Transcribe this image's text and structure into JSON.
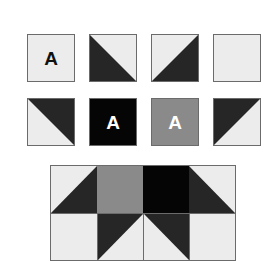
{
  "colors": {
    "light": "#ececec",
    "dark": "#262626",
    "black": "#050505",
    "gray": "#8a8a8a",
    "border": "#6b6b6b",
    "letter_dark": "#111111",
    "letter_light": "#ffffff"
  },
  "tiles": {
    "row1": [
      {
        "type": "light-with-letter",
        "letter": "A"
      },
      {
        "type": "half-square",
        "dark_half": "bottom-left"
      },
      {
        "type": "half-square",
        "dark_half": "bottom-right"
      },
      {
        "type": "plain-light"
      }
    ],
    "row2": [
      {
        "type": "half-square",
        "dark_half": "top-right"
      },
      {
        "type": "black-with-letter",
        "letter": "A"
      },
      {
        "type": "gray-with-letter",
        "letter": "A"
      },
      {
        "type": "half-square",
        "dark_half": "top-left"
      }
    ]
  },
  "quilt_block": {
    "grid": "4x2",
    "row1": [
      "half-square dark bottom-right",
      "solid gray",
      "solid black",
      "half-square dark bottom-left"
    ],
    "row2": [
      "plain light",
      "half-square dark top-left",
      "half-square dark top-right",
      "plain light"
    ]
  }
}
